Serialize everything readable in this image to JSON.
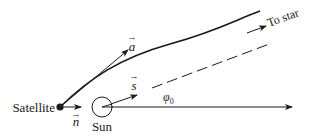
{
  "diagram": {
    "colors": {
      "stroke": "#1a1a1a",
      "background": "#ffffff"
    },
    "labels": {
      "satellite": "Satellite",
      "sun": "Sun",
      "to_star": "To star",
      "vec_a": "a",
      "vec_s": "s",
      "vec_n": "n",
      "phi": "φ",
      "phi_sub": "0",
      "vec_arrow": "→"
    },
    "elements": {
      "satellite_point": {
        "x": 60,
        "y": 107
      },
      "sun_circle": {
        "cx": 102,
        "cy": 107,
        "r": 10
      },
      "baseline_arrow": {
        "from": [
          102,
          107
        ],
        "to": [
          292,
          107
        ]
      },
      "trajectory_curve": {
        "from": [
          60,
          107
        ],
        "to": [
          260,
          11
        ]
      },
      "dashed_line": {
        "from": [
          152,
          88
        ],
        "to": [
          272,
          43
        ]
      },
      "vector_a": {
        "from": [
          60,
          107
        ],
        "to": [
          128,
          50
        ]
      },
      "vector_s": {
        "from": [
          102,
          107
        ],
        "to": [
          137,
          95
        ]
      },
      "vector_n": {
        "from": [
          63,
          107
        ],
        "to": [
          81,
          107
        ]
      },
      "to_star_arrow": {
        "from": [
          247,
          33
        ],
        "to": [
          266,
          26
        ]
      }
    }
  }
}
